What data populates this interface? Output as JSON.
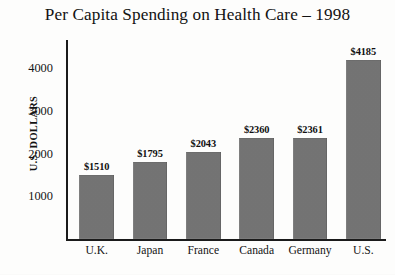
{
  "chart_data": {
    "type": "bar",
    "title": "Per Capita Spending on Health Care – 1998",
    "xlabel": "",
    "ylabel": "U.S. DOLLARS",
    "categories": [
      "U.K.",
      "Japan",
      "France",
      "Canada",
      "Germany",
      "U.S."
    ],
    "values": [
      1510,
      1795,
      2043,
      2360,
      2361,
      4185
    ],
    "value_labels": [
      "$1510",
      "$1795",
      "$2043",
      "$2360",
      "$2361",
      "$4185"
    ],
    "ylim": [
      0,
      4500
    ],
    "yticks": [
      1000,
      2000,
      3000,
      4000
    ],
    "ytick_labels": [
      "1000",
      "2000",
      "3000",
      "4000"
    ],
    "grid": false,
    "legend": false,
    "bar_color": "#7b7b7b",
    "axis_color": "#1b1b1b",
    "background": "#fdfdfc"
  }
}
